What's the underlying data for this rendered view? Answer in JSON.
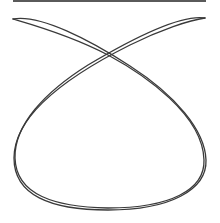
{
  "figure": {
    "top_bar_color": "#5a5a5a",
    "stroke_color": "#3a3a3a",
    "background": "#ffffff",
    "paths": [
      "M13,19 C40,14 90,40 130,66 C175,95 205,130 206,160 C207,190 170,210 108,210 C50,210 14,195 14,158 C14,110 80,70 130,45 C160,30 190,20 205,18",
      "M205,18 C180,14 130,40 88,65 C45,92 14,125 15,158 C16,195 55,207 108,208 C170,208 205,190 204,160 C203,115 145,75 108,55 C70,35 30,24 13,19"
    ]
  }
}
